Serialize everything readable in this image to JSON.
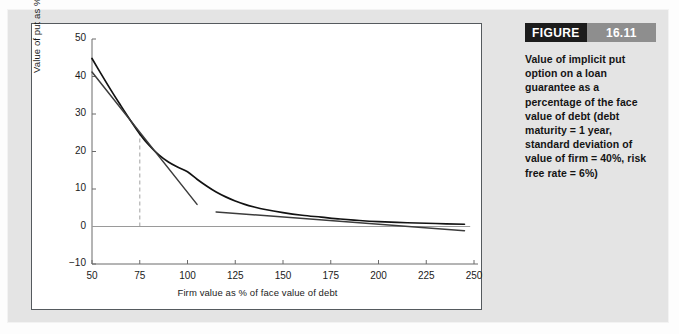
{
  "figure": {
    "badge_word": "FIGURE",
    "badge_number": "16.11",
    "caption": "Value of implicit put option on a loan guarantee as a percentage of the face value of debt (debt maturity = 1 year, standard deviation of value of firm = 40%, risk free rate = 6%)"
  },
  "colors": {
    "page_background": "#e4e4e4",
    "panel_background": "#ffffff",
    "panel_border": "#555a5e",
    "curve": "#121212",
    "tangent": "#3c3c3c",
    "zero_line": "#9a9a9a",
    "dashed_guide": "#b8b8b8",
    "badge_dark": "#1c1c1c",
    "badge_grey": "#8e8e8e",
    "text": "#141414"
  },
  "chart_data": {
    "type": "line",
    "title": "",
    "xlabel": "Firm value as % of face value of debt",
    "ylabel": "Value of put as % of face value of debt",
    "xlim": [
      50,
      250
    ],
    "ylim": [
      -10,
      50
    ],
    "xticks": [
      50,
      75,
      100,
      125,
      150,
      175,
      200,
      225,
      250
    ],
    "yticks": [
      -10,
      0,
      10,
      20,
      30,
      40,
      50
    ],
    "xticklabels": [
      "50",
      "75",
      "100",
      "125",
      "150",
      "175",
      "200",
      "225",
      "250"
    ],
    "yticklabels": [
      "-10",
      "0",
      "10",
      "20",
      "30",
      "40",
      "50"
    ],
    "grid": false,
    "legend": null,
    "series": [
      {
        "name": "Value of implicit put option",
        "role": "curve",
        "x": [
          50,
          55,
          60,
          65,
          70,
          75,
          80,
          85,
          90,
          95,
          100,
          105,
          110,
          115,
          120,
          125,
          130,
          135,
          140,
          150,
          160,
          170,
          180,
          190,
          200,
          215,
          230,
          245
        ],
        "values": [
          44.8,
          40.5,
          36.3,
          32.3,
          28.4,
          24.7,
          21.6,
          19.1,
          17.2,
          15.8,
          14.6,
          12.6,
          10.8,
          9.2,
          7.9,
          6.8,
          5.9,
          5.2,
          4.6,
          3.7,
          3.0,
          2.5,
          2.0,
          1.6,
          1.3,
          1.0,
          0.8,
          0.6
        ]
      },
      {
        "name": "Tangent at firm value 75",
        "role": "tangent",
        "x": [
          50,
          105
        ],
        "values": [
          41.2,
          5.9
        ]
      },
      {
        "name": "Tangent at firm value 175",
        "role": "tangent",
        "x": [
          115,
          245
        ],
        "values": [
          3.9,
          -1.1
        ]
      }
    ],
    "annotations": [
      {
        "type": "vertical-dashed-line",
        "x": 75,
        "y_from": 0,
        "y_to": 24.7,
        "label": ""
      },
      {
        "type": "horizontal-zero-line",
        "y": 0,
        "x_from": 50,
        "x_to": 248
      }
    ]
  }
}
